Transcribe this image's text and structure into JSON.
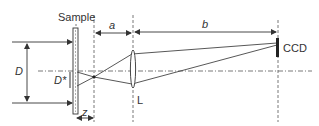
{
  "diagram": {
    "type": "optical-setup",
    "labels": {
      "sample": "Sample",
      "distance_a": "a",
      "distance_b": "b",
      "detector": "CCD",
      "beam_diameter": "D",
      "spot_diameter": "D*",
      "offset_z": "z",
      "lens": "L"
    },
    "components": [
      {
        "id": "sample",
        "label": "Sample",
        "kind": "thin plate"
      },
      {
        "id": "focal-point",
        "label": "",
        "kind": "crossover point"
      },
      {
        "id": "lens",
        "label": "L",
        "kind": "convex lens"
      },
      {
        "id": "ccd",
        "label": "CCD",
        "kind": "detector"
      }
    ],
    "dimensions": [
      {
        "symbol": "D",
        "meaning": "incident beam diameter"
      },
      {
        "symbol": "D*",
        "meaning": "beam diameter at sample exit"
      },
      {
        "symbol": "z",
        "meaning": "sample to focal point distance"
      },
      {
        "symbol": "a",
        "meaning": "focal point to lens distance"
      },
      {
        "symbol": "b",
        "meaning": "lens to CCD distance"
      }
    ],
    "colors": {
      "line": "#333333",
      "background": "#ffffff"
    }
  }
}
